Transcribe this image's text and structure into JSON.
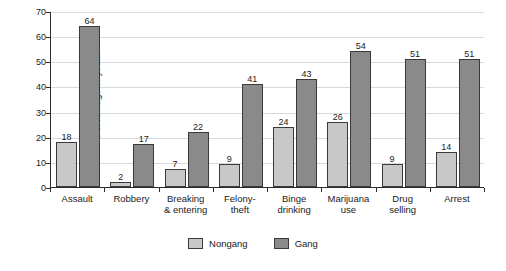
{
  "chart_data": {
    "type": "bar",
    "title": "",
    "xlabel": "",
    "ylabel": "Percentage of youth",
    "ylim": [
      0,
      70
    ],
    "yticks": [
      0,
      10,
      20,
      30,
      40,
      50,
      60,
      70
    ],
    "grid": true,
    "legend_position": "bottom",
    "categories": [
      "Assault",
      "Robbery",
      "Breaking\n& entering",
      "Felony-\ntheft",
      "Binge\ndrinking",
      "Marijuana\nuse",
      "Drug\nselling",
      "Arrest"
    ],
    "series": [
      {
        "name": "Nongang",
        "color": "#c8c8c8",
        "values": [
          18,
          2,
          7,
          9,
          24,
          26,
          9,
          14
        ]
      },
      {
        "name": "Gang",
        "color": "#8a8a8a",
        "values": [
          64,
          17,
          22,
          41,
          43,
          54,
          51,
          51
        ]
      }
    ]
  }
}
